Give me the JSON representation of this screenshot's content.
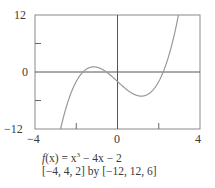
{
  "chart_data": {
    "type": "line",
    "title": "",
    "function": "f(x) = x^3 - 4x - 2",
    "xlabel": "",
    "ylabel": "",
    "xlim": [
      -4,
      4
    ],
    "ylim": [
      -12,
      12
    ],
    "xscale": 2,
    "yscale": 6,
    "x_tick_labels": [
      "-4",
      "0",
      "4"
    ],
    "y_tick_labels": [
      "12",
      "0",
      "-12"
    ],
    "grid": false,
    "series": [
      {
        "name": "f(x)",
        "x": [
          -2.7,
          -2.5,
          -2.0,
          -1.5,
          -1.155,
          -1.0,
          -0.5,
          0.0,
          0.5,
          1.0,
          1.155,
          1.5,
          2.0,
          2.5,
          3.0,
          3.05
        ],
        "y": [
          -11.88,
          -7.63,
          -2.0,
          0.63,
          1.08,
          1.0,
          -0.13,
          -2.0,
          -3.88,
          -5.0,
          -5.08,
          -4.63,
          -2.0,
          3.63,
          13.0,
          14.17
        ]
      }
    ]
  },
  "labels": {
    "y_top": "12",
    "y_mid": "0",
    "y_bottom": "−12",
    "x_left": "−4",
    "x_mid": "0",
    "x_right": "4"
  },
  "caption": {
    "func_prefix": "f",
    "func_text": "(x) = x",
    "func_exp": "3",
    "func_rest": " − 4x − 2",
    "window": "[−4, 4, 2] by [−12, 12, 6]"
  }
}
